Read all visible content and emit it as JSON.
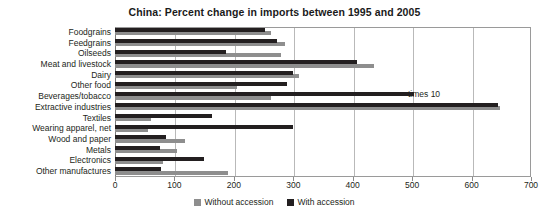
{
  "chart_data": {
    "type": "bar",
    "orientation": "horizontal",
    "title": "China:  Percent change in imports between 1995 and 2005",
    "xlabel": "",
    "ylabel": "",
    "xlim": [
      0,
      700
    ],
    "xticks": [
      0,
      100,
      200,
      300,
      400,
      500,
      600,
      700
    ],
    "grid": true,
    "legend_position": "bottom",
    "categories": [
      "Foodgrains",
      "Feedgrains",
      "Oilseeds",
      "Meat and livestock",
      "Dairy",
      "Other food",
      "Beverages/tobacco",
      "Extractive industries",
      "Textiles",
      "Wearing apparel, net",
      "Wood and paper",
      "Metals",
      "Electronics",
      "Other manufactures"
    ],
    "series": [
      {
        "name": "Without accession",
        "color": "#8e8e8e",
        "values": [
          263,
          286,
          280,
          435,
          310,
          205,
          263,
          648,
          60,
          55,
          117,
          105,
          80,
          190
        ]
      },
      {
        "name": "With accession",
        "color": "#231f20",
        "values": [
          252,
          273,
          186,
          407,
          300,
          290,
          503,
          645,
          163,
          300,
          85,
          75,
          150,
          78
        ]
      }
    ],
    "annotations": [
      {
        "text": "times 10",
        "category": "Beverages/tobacco",
        "x_value": 493
      }
    ]
  }
}
